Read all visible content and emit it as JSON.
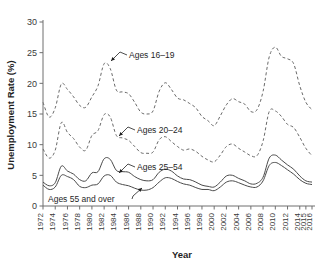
{
  "chart_data": {
    "type": "line",
    "title": "",
    "xlabel": "Year",
    "ylabel": "Unemployment Rate (%)",
    "xlim": [
      1972,
      2016
    ],
    "ylim": [
      0,
      30
    ],
    "ytick_values": [
      0,
      5,
      10,
      15,
      20,
      25,
      30
    ],
    "ytick_labels": [
      "0",
      "5",
      "10",
      "15",
      "20",
      "25",
      "30"
    ],
    "xtick_labels": [
      "1972",
      "1974",
      "1976",
      "1978",
      "1980",
      "1982",
      "1984",
      "1986",
      "1988",
      "1990",
      "1992",
      "1994",
      "1996",
      "1998",
      "2000",
      "2002",
      "2004",
      "2006",
      "2008",
      "2010",
      "2012",
      "2014",
      "2015",
      "2016"
    ],
    "grid": false,
    "legend_position": "inline-annotations",
    "x": [
      1972,
      1973,
      1974,
      1975,
      1976,
      1977,
      1978,
      1979,
      1980,
      1981,
      1982,
      1983,
      1984,
      1985,
      1986,
      1987,
      1988,
      1989,
      1990,
      1991,
      1992,
      1993,
      1994,
      1995,
      1996,
      1997,
      1998,
      1999,
      2000,
      2001,
      2002,
      2003,
      2004,
      2005,
      2006,
      2007,
      2008,
      2009,
      2010,
      2011,
      2012,
      2013,
      2014,
      2015,
      2016
    ],
    "series": [
      {
        "name": "Ages 16–19",
        "style": "dashed",
        "values": [
          16.9,
          14.5,
          16.0,
          19.9,
          19.0,
          17.8,
          16.4,
          16.1,
          17.8,
          19.6,
          23.2,
          22.4,
          18.9,
          18.6,
          18.3,
          16.9,
          15.3,
          15.0,
          15.5,
          18.7,
          20.1,
          19.0,
          17.6,
          17.3,
          16.7,
          16.0,
          14.6,
          13.9,
          13.1,
          14.7,
          16.5,
          17.5,
          17.0,
          16.6,
          15.4,
          15.7,
          18.7,
          24.3,
          25.9,
          24.4,
          24.0,
          23.2,
          19.6,
          16.9,
          15.7
        ]
      },
      {
        "name": "Ages 20–24",
        "style": "dashed",
        "values": [
          9.3,
          7.8,
          9.1,
          13.6,
          12.0,
          11.0,
          9.6,
          9.1,
          11.5,
          12.3,
          14.9,
          14.5,
          11.5,
          11.1,
          10.7,
          9.7,
          8.7,
          8.6,
          8.8,
          10.8,
          11.3,
          10.5,
          9.7,
          9.1,
          9.3,
          8.9,
          8.1,
          7.5,
          7.2,
          8.3,
          9.7,
          10.1,
          9.4,
          8.8,
          8.2,
          8.2,
          10.6,
          15.4,
          15.5,
          14.6,
          13.3,
          12.8,
          11.2,
          9.4,
          8.2
        ]
      },
      {
        "name": "Ages 25–54",
        "style": "solid",
        "values": [
          3.9,
          3.3,
          3.8,
          6.5,
          5.7,
          5.2,
          4.3,
          4.1,
          5.4,
          5.6,
          7.7,
          7.6,
          5.8,
          5.6,
          5.5,
          4.8,
          4.3,
          4.1,
          4.3,
          5.5,
          6.0,
          5.7,
          4.9,
          4.4,
          4.3,
          3.9,
          3.4,
          3.2,
          3.1,
          3.9,
          4.9,
          5.0,
          4.5,
          4.1,
          3.6,
          3.7,
          4.7,
          7.8,
          8.3,
          7.5,
          6.7,
          6.0,
          4.9,
          4.1,
          3.9
        ]
      },
      {
        "name": "Ages 55 and over",
        "style": "solid",
        "values": [
          3.4,
          2.7,
          3.1,
          5.0,
          4.8,
          4.3,
          3.2,
          3.0,
          3.4,
          3.6,
          4.9,
          5.0,
          3.9,
          3.5,
          3.3,
          2.9,
          2.6,
          2.6,
          3.0,
          3.9,
          4.6,
          4.5,
          4.0,
          3.6,
          3.4,
          3.0,
          2.7,
          2.7,
          2.5,
          3.1,
          3.9,
          4.1,
          3.8,
          3.4,
          3.1,
          3.1,
          4.1,
          6.6,
          7.1,
          6.6,
          5.9,
          5.2,
          4.3,
          3.7,
          3.5
        ]
      }
    ],
    "annotations": [
      {
        "name": "ages-16-19",
        "label": "Ages 16–19",
        "text_x": 129,
        "text_y": 55
      },
      {
        "name": "ages-20-24",
        "label": "Ages 20–24",
        "text_x": 137,
        "text_y": 130
      },
      {
        "name": "ages-25-54",
        "label": "Ages 25–54",
        "text_x": 137,
        "text_y": 167
      },
      {
        "name": "ages-55-over",
        "label": "Ages 55 and over",
        "text_x": 48,
        "text_y": 199
      }
    ]
  },
  "colors": {
    "axis": "#6f6f6f",
    "dashed_series": "#6a6a6a",
    "solid_series": "#4a4a4a",
    "text": "#1f1f1f",
    "background": "#ffffff"
  }
}
